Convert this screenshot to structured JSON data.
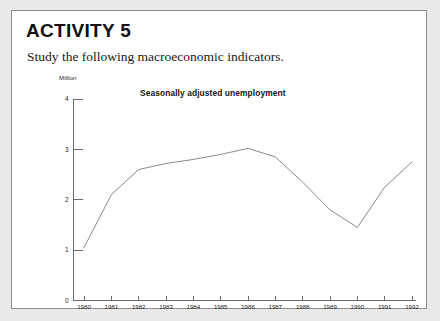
{
  "activity": {
    "title": "ACTIVITY 5",
    "instruction": "Study the following macroeconomic indicators."
  },
  "chart_data": {
    "type": "line",
    "title": "Seasonally adjusted unemployment",
    "ylabel": "Million",
    "xlabel": "",
    "unit_label": "Million",
    "categories": [
      "1980",
      "1981",
      "1982",
      "1983",
      "1984",
      "1985",
      "1986",
      "1987",
      "1988",
      "1989",
      "1990",
      "1991",
      "1992"
    ],
    "values": [
      1.05,
      2.1,
      2.6,
      2.72,
      2.8,
      2.9,
      3.02,
      2.85,
      2.35,
      1.8,
      1.45,
      2.25,
      2.75
    ],
    "series": [
      {
        "name": "Seasonally adjusted unemployment",
        "values": [
          1.05,
          2.1,
          2.6,
          2.72,
          2.8,
          2.9,
          3.02,
          2.85,
          2.35,
          1.8,
          1.45,
          2.25,
          2.75
        ]
      }
    ],
    "ylim": [
      0,
      4
    ],
    "yticks": [
      0,
      1,
      2,
      3,
      4
    ],
    "ytick_labels": [
      "0",
      "1",
      "2",
      "3",
      "4"
    ],
    "grid": false,
    "legend": "none",
    "line_color": "#8a8a8a",
    "axis_color": "#6b6b6b"
  },
  "style": {
    "page_background": "#e9e9e9",
    "card_background": "#ffffff",
    "border_color": "#8d8d8d",
    "text_color": "#101010"
  }
}
